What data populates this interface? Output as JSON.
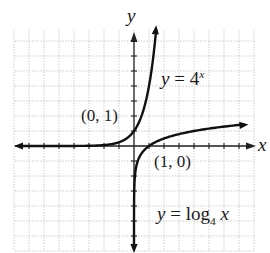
{
  "chart_data": {
    "type": "line",
    "title": "",
    "xlabel": "x",
    "ylabel": "y",
    "xlim": [
      -8,
      8
    ],
    "ylim": [
      -7,
      8
    ],
    "grid": true,
    "grid_step": 1,
    "series": [
      {
        "name": "y = 4^x",
        "function": "4^x",
        "label_parts": {
          "lhs": "y",
          "eq": " = ",
          "base": "4",
          "exp": "x"
        },
        "x_range": [
          -8,
          1.5
        ],
        "direction_arrows": "both",
        "points": [
          [
            -8,
            1.53e-05
          ],
          [
            -2,
            0.0625
          ],
          [
            -1,
            0.25
          ],
          [
            0,
            1
          ],
          [
            0.5,
            2
          ],
          [
            1,
            4
          ],
          [
            1.5,
            8
          ]
        ]
      },
      {
        "name": "y = log_4 x",
        "function": "log4(x)",
        "label_parts": {
          "lhs": "y",
          "eq": " = ",
          "fn": "log",
          "sub": "4",
          "arg": "x"
        },
        "x_range": [
          0.005,
          8
        ],
        "direction_arrows": "both",
        "points": [
          [
            0.0625,
            -2
          ],
          [
            0.25,
            -1
          ],
          [
            1,
            0
          ],
          [
            4,
            1
          ],
          [
            8,
            1.5
          ]
        ]
      }
    ],
    "annotations": [
      {
        "text": "(0, 1)",
        "x": 0,
        "y": 1
      },
      {
        "text": "(1, 0)",
        "x": 1,
        "y": 0
      }
    ]
  },
  "labels": {
    "axis_x": "x",
    "axis_y": "y",
    "point_exp": "(0, 1)",
    "point_log": "(1, 0)",
    "exp_lhs": "y",
    "exp_eq": " = 4",
    "exp_sup": "x",
    "log_lhs": "y",
    "log_eq": " = log",
    "log_sub": "4",
    "log_arg": "x"
  },
  "colors": {
    "curve": "#111111",
    "axis": "#222222",
    "grid": "#b5b5b5",
    "background": "#ffffff"
  }
}
